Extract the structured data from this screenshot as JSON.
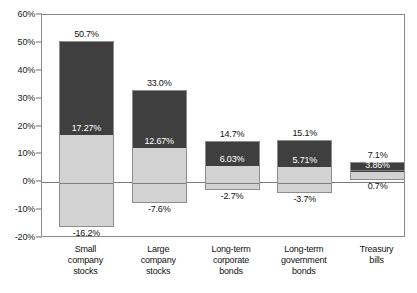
{
  "chart_data": {
    "type": "bar",
    "title": "",
    "xlabel": "",
    "ylabel": "",
    "ylim": [
      -20,
      60
    ],
    "grid": false,
    "legend_position": "none",
    "y_ticks": [
      "60%",
      "50%",
      "40%",
      "30%",
      "20%",
      "10%",
      "0%",
      "-10%",
      "-20%"
    ],
    "y_tick_values": [
      60,
      50,
      40,
      30,
      20,
      10,
      0,
      -10,
      -20
    ],
    "categories": [
      "Small company stocks",
      "Large company stocks",
      "Long-term corporate bonds",
      "Long-term government bonds",
      "Treasury bills"
    ],
    "series": [
      {
        "name": "Maximum return",
        "values": [
          50.7,
          33.0,
          14.7,
          15.1,
          7.1
        ]
      },
      {
        "name": "Average return",
        "values": [
          17.27,
          12.67,
          6.03,
          5.71,
          3.86
        ]
      },
      {
        "name": "Minimum return",
        "values": [
          -16.2,
          -7.6,
          -2.7,
          -3.7,
          0.7
        ]
      }
    ],
    "bars": [
      {
        "category_lines": [
          "Small",
          "company",
          "stocks"
        ],
        "max": 50.7,
        "mean": 17.27,
        "min": -16.2,
        "max_label": "50.7%",
        "mean_label": "17.27%",
        "min_label": "-16.2%"
      },
      {
        "category_lines": [
          "Large",
          "company",
          "stocks"
        ],
        "max": 33.0,
        "mean": 12.67,
        "min": -7.6,
        "max_label": "33.0%",
        "mean_label": "12.67%",
        "min_label": "-7.6%"
      },
      {
        "category_lines": [
          "Long-term",
          "corporate",
          "bonds"
        ],
        "max": 14.7,
        "mean": 6.03,
        "min": -2.7,
        "max_label": "14.7%",
        "mean_label": "6.03%",
        "min_label": "-2.7%"
      },
      {
        "category_lines": [
          "Long-term",
          "government",
          "bonds"
        ],
        "max": 15.1,
        "mean": 5.71,
        "min": -3.7,
        "max_label": "15.1%",
        "mean_label": "5.71%",
        "min_label": "-3.7%"
      },
      {
        "category_lines": [
          "Treasury",
          "bills"
        ],
        "max": 7.1,
        "mean": 3.86,
        "min": 0.7,
        "max_label": "7.1%",
        "mean_label": "3.86%",
        "min_label": "0.7%"
      }
    ]
  },
  "colors": {
    "bar_dark": "#3f3f3f",
    "bar_light": "#d2d2d2",
    "bar_border": "#8e8e8e",
    "axis": "#8a8a8a",
    "text": "#111111",
    "background": "#ffffff"
  }
}
